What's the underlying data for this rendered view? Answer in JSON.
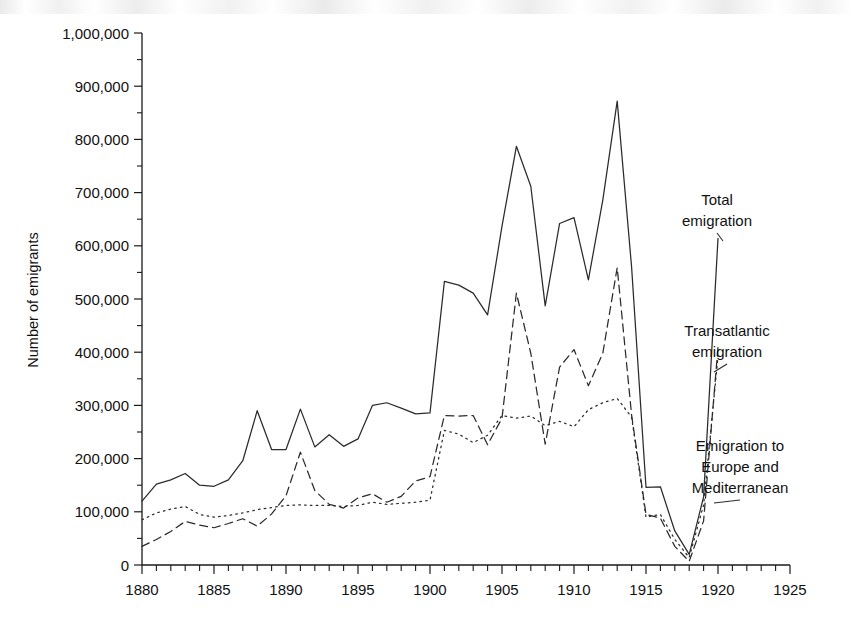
{
  "chart_data": {
    "type": "line",
    "title": "",
    "subtitle": "",
    "xlabel": "",
    "ylabel": "Number of emigrants",
    "xlim": [
      1880,
      1925
    ],
    "ylim": [
      0,
      1000000
    ],
    "grid": false,
    "legend_position": "right-inline-annotations",
    "x_tick_labels": [
      "1880",
      "1885",
      "1890",
      "1895",
      "1900",
      "1905",
      "1910",
      "1915",
      "1920",
      "1925"
    ],
    "x_major_ticks": [
      1880,
      1885,
      1890,
      1895,
      1900,
      1905,
      1910,
      1915,
      1920,
      1925
    ],
    "x_minor_tick_interval": 1,
    "y_tick_labels": [
      "0",
      "100,000",
      "200,000",
      "300,000",
      "400,000",
      "500,000",
      "600,000",
      "700,000",
      "800,000",
      "900,000",
      "1,000,000"
    ],
    "y_major_ticks": [
      0,
      100000,
      200000,
      300000,
      400000,
      500000,
      600000,
      700000,
      800000,
      900000,
      1000000
    ],
    "y_minor_tick_interval": 50000,
    "x": [
      1880,
      1881,
      1882,
      1883,
      1884,
      1885,
      1886,
      1887,
      1888,
      1889,
      1890,
      1891,
      1892,
      1893,
      1894,
      1895,
      1896,
      1897,
      1898,
      1899,
      1900,
      1901,
      1902,
      1903,
      1904,
      1905,
      1906,
      1907,
      1908,
      1909,
      1910,
      1911,
      1912,
      1913,
      1914,
      1915,
      1916,
      1917,
      1918,
      1919,
      1920
    ],
    "series": [
      {
        "name": "Total emigration",
        "style": "solid",
        "color": "#2b2b2b",
        "values": [
          120000,
          152000,
          160000,
          172000,
          150000,
          148000,
          160000,
          196000,
          290000,
          217000,
          217000,
          293000,
          222000,
          245000,
          223000,
          237000,
          300000,
          305000,
          295000,
          284000,
          286000,
          533000,
          526000,
          511000,
          470000,
          637000,
          787000,
          712000,
          487000,
          642000,
          653000,
          536000,
          686000,
          872000,
          560000,
          146000,
          147000,
          64000,
          20000,
          128000,
          614000
        ]
      },
      {
        "name": "Transatlantic emigration",
        "style": "dashed",
        "color": "#2b2b2b",
        "values": [
          35000,
          48000,
          63000,
          82000,
          75000,
          70000,
          78000,
          87000,
          73000,
          96000,
          130000,
          212000,
          140000,
          114000,
          107000,
          126000,
          134000,
          118000,
          129000,
          158000,
          166000,
          281000,
          280000,
          281000,
          226000,
          276000,
          511000,
          398000,
          227000,
          372000,
          405000,
          337000,
          398000,
          559000,
          282000,
          95000,
          88000,
          35000,
          7000,
          83000,
          410000
        ]
      },
      {
        "name": "Emigration to Europe and Mediterranean",
        "style": "dotted",
        "color": "#2b2b2b",
        "values": [
          85000,
          98000,
          105000,
          110000,
          95000,
          90000,
          93000,
          98000,
          104000,
          108000,
          112000,
          113000,
          112000,
          112000,
          110000,
          112000,
          118000,
          114000,
          116000,
          118000,
          122000,
          253000,
          246000,
          230000,
          244000,
          281000,
          276000,
          280000,
          262000,
          270000,
          260000,
          292000,
          305000,
          313000,
          278000,
          90000,
          95000,
          48000,
          14000,
          113000,
          392000
        ]
      }
    ],
    "annotations": [
      {
        "id": "total",
        "lines": [
          "Total",
          "emigration"
        ]
      },
      {
        "id": "transatlantic",
        "lines": [
          "Transatlantic",
          "emigration"
        ]
      },
      {
        "id": "europe-med",
        "lines": [
          "Emigration to",
          "Europe and",
          "Mediterranean"
        ]
      }
    ]
  }
}
